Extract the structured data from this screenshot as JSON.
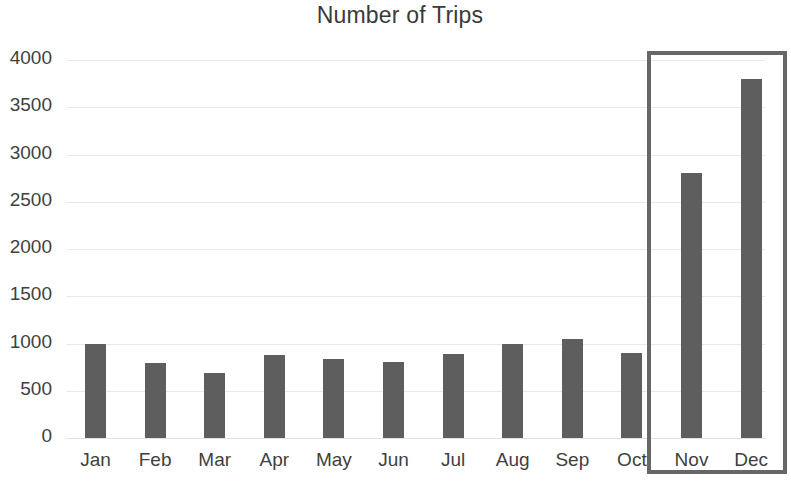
{
  "chart_data": {
    "type": "bar",
    "title": "Number of Trips",
    "xlabel": "",
    "ylabel": "",
    "categories": [
      "Jan",
      "Feb",
      "Mar",
      "Apr",
      "May",
      "Jun",
      "Jul",
      "Aug",
      "Sep",
      "Oct",
      "Nov",
      "Dec"
    ],
    "values": [
      1000,
      790,
      690,
      880,
      840,
      800,
      890,
      1000,
      1050,
      900,
      2800,
      3800
    ],
    "ylim": [
      0,
      4000
    ],
    "ytick_step": 500,
    "ytick_labels": [
      "4000",
      "3500",
      "3000",
      "2500",
      "2000",
      "1500",
      "1000",
      "500",
      "0"
    ],
    "ytick_values": [
      4000,
      3500,
      3000,
      2500,
      2000,
      1500,
      1000,
      500,
      0
    ],
    "grid": true,
    "grid_axis": "y",
    "legend": false,
    "legend_position": "none",
    "bar_color": "#5e5e5e",
    "grid_color": "#e9e9e9",
    "text_color": "#3f3f3f",
    "background_color": "#ffffff",
    "annotations": [
      {
        "type": "highlight-rectangle",
        "name": "holiday-months-highlight",
        "covers": [
          "Nov",
          "Dec"
        ],
        "color": "#676767"
      }
    ]
  }
}
